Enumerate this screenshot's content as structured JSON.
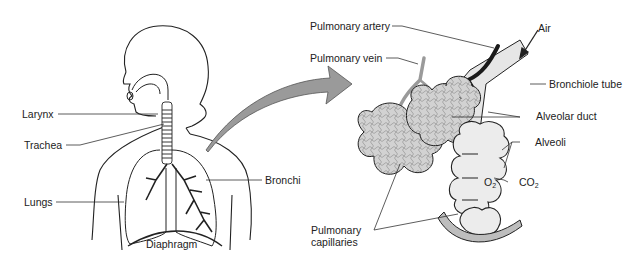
{
  "diagram": {
    "left_panel": {
      "name": "Respiratory tract overview",
      "labels": {
        "larynx": "Larynx",
        "trachea": "Trachea",
        "lungs": "Lungs",
        "bronchi": "Bronchi",
        "diaphragm": "Diaphragm"
      }
    },
    "right_panel": {
      "name": "Alveoli detail (magnified)",
      "labels": {
        "pulmonary_artery": "Pulmonary artery",
        "pulmonary_vein": "Pulmonary vein",
        "air": "Air",
        "bronchiole_tube": "Bronchiole tube",
        "alveolar_duct": "Alveolar duct",
        "alveoli": "Alveoli",
        "o2_main": "O",
        "o2_sub": "2",
        "co2_main": "CO",
        "co2_sub": "2",
        "pulmonary_capillaries_line1": "Pulmonary",
        "pulmonary_capillaries_line2": "capillaries"
      }
    },
    "connector": {
      "icon": "curved-magnify-arrow",
      "color": "#9a9a9a"
    },
    "colors": {
      "outline": "#222222",
      "artery": "#1a1a1a",
      "vein": "#9a9a9a",
      "alveoli_fill": "#d4d4d4",
      "bronchiole_fill": "#e6e6e6",
      "capillary_fill": "#bdbdbd"
    }
  }
}
